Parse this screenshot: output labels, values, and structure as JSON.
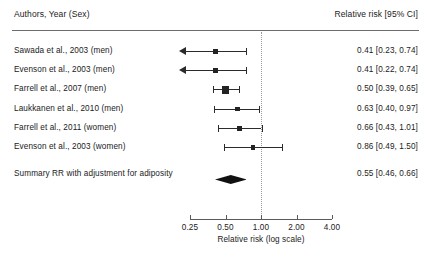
{
  "header": {
    "left_label": "Authors, Year (Sex)",
    "right_label": "Relative risk [95% CI]"
  },
  "chart_data": {
    "type": "forest",
    "title": "",
    "xlabel": "Relative risk (log scale)",
    "ylabel": "",
    "scale": "log",
    "null_value": 1.0,
    "xlim": [
      0.25,
      4.0
    ],
    "ticks": [
      "0.25",
      "0.50",
      "1.00",
      "2.00",
      "4.00"
    ],
    "tick_values": [
      0.25,
      0.5,
      1.0,
      2.0,
      4.0
    ],
    "grid": false,
    "legend": "none",
    "columns": [
      "Authors, Year (Sex)",
      "Relative risk [95% CI]"
    ],
    "rows": [
      {
        "label": "Sawada et al., 2003 (men)",
        "value_text": "0.41 [0.23, 0.74]",
        "estimate": 0.41,
        "ci_low": 0.23,
        "ci_high": 0.74,
        "weight": 0.3,
        "clipped_left": true
      },
      {
        "label": "Evenson et al., 2003 (men)",
        "value_text": "0.41 [0.22, 0.74]",
        "estimate": 0.41,
        "ci_low": 0.22,
        "ci_high": 0.74,
        "weight": 0.3,
        "clipped_left": true
      },
      {
        "label": "Farrell et al., 2007 (men)",
        "value_text": "0.50 [0.39, 0.65]",
        "estimate": 0.5,
        "ci_low": 0.39,
        "ci_high": 0.65,
        "weight": 1.0,
        "clipped_left": false
      },
      {
        "label": "Laukkanen et al., 2010 (men)",
        "value_text": "0.63 [0.40, 0.97]",
        "estimate": 0.63,
        "ci_low": 0.4,
        "ci_high": 0.97,
        "weight": 0.34,
        "clipped_left": false
      },
      {
        "label": "Farrell et al., 2011 (women)",
        "value_text": "0.66 [0.43, 1.01]",
        "estimate": 0.66,
        "ci_low": 0.43,
        "ci_high": 1.01,
        "weight": 0.34,
        "clipped_left": false
      },
      {
        "label": "Evenson et al., 2003 (women)",
        "value_text": "0.86 [0.49, 1.50]",
        "estimate": 0.86,
        "ci_low": 0.49,
        "ci_high": 1.5,
        "weight": 0.3,
        "clipped_left": false
      }
    ],
    "summary": {
      "label": "Summary RR with adjustment for adiposity",
      "value_text": "0.55 [0.46, 0.66]",
      "estimate": 0.55,
      "ci_low": 0.46,
      "ci_high": 0.66
    }
  }
}
